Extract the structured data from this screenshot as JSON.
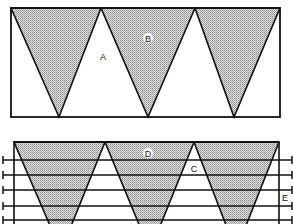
{
  "diagram": {
    "upper_panel": {
      "labels": {
        "A": "A",
        "B": "B"
      },
      "rect": {
        "x": 11,
        "y": 8,
        "w": 269,
        "h": 109
      },
      "triangles": [
        {
          "points": "11,8 101,8 59,117"
        },
        {
          "points": "101,8 195,8 148,117"
        },
        {
          "points": "195,8 280,8 234,117"
        }
      ]
    },
    "lower_panel": {
      "labels": {
        "C": "C",
        "D": "D",
        "E": "E"
      },
      "rect": {
        "x": 14,
        "y": 142,
        "w": 265,
        "h": 90
      },
      "horizontal_lines_y": [
        160,
        175,
        190,
        206,
        220
      ],
      "triangles": [
        {
          "points": "14,142 105,142 61,251"
        },
        {
          "points": "105,142 194,142 150,251"
        },
        {
          "points": "194,142 279,142 236,251"
        }
      ]
    },
    "colors": {
      "stroke": "#111111",
      "fill_dots": "#9a9a9a",
      "background": "#ffffff"
    }
  }
}
